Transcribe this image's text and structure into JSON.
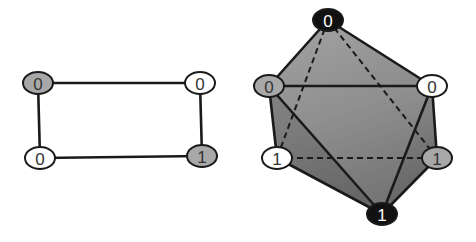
{
  "colors": {
    "stroke": "#1a1a1a",
    "node_white": "#ffffff",
    "node_gray": "#a8a8a8",
    "node_black": "#111111",
    "text_dark": "#333333",
    "text_light": "#ffffff",
    "face_light": "#9a9a9a",
    "face_mid": "#8a8a8a",
    "face_dark": "#6e6e6e"
  },
  "left_graph": {
    "name": "square-graph",
    "nodes": [
      {
        "id": "tl",
        "label": "0",
        "x": 38,
        "y": 83,
        "fill": "gray"
      },
      {
        "id": "tr",
        "label": "0",
        "x": 200,
        "y": 83,
        "fill": "white"
      },
      {
        "id": "bl",
        "label": "0",
        "x": 40,
        "y": 158,
        "fill": "white"
      },
      {
        "id": "br",
        "label": "1",
        "x": 202,
        "y": 156,
        "fill": "gray"
      }
    ],
    "edges": [
      [
        "tl",
        "tr"
      ],
      [
        "tr",
        "br"
      ],
      [
        "br",
        "bl"
      ],
      [
        "bl",
        "tl"
      ]
    ]
  },
  "right_graph": {
    "name": "octahedron-graph",
    "nodes": [
      {
        "id": "top",
        "label": "0",
        "x": 328,
        "y": 20,
        "fill": "black"
      },
      {
        "id": "ul",
        "label": "0",
        "x": 269,
        "y": 86,
        "fill": "gray"
      },
      {
        "id": "ur",
        "label": "0",
        "x": 432,
        "y": 86,
        "fill": "white"
      },
      {
        "id": "ll",
        "label": "1",
        "x": 277,
        "y": 158,
        "fill": "white"
      },
      {
        "id": "lr",
        "label": "1",
        "x": 437,
        "y": 158,
        "fill": "gray"
      },
      {
        "id": "bot",
        "label": "1",
        "x": 382,
        "y": 214,
        "fill": "black"
      }
    ],
    "solid_edges": [
      [
        "top",
        "ul"
      ],
      [
        "top",
        "ur"
      ],
      [
        "ul",
        "ur"
      ],
      [
        "ul",
        "ll"
      ],
      [
        "ur",
        "lr"
      ],
      [
        "ll",
        "bot"
      ],
      [
        "lr",
        "bot"
      ],
      [
        "ul",
        "bot"
      ],
      [
        "ur",
        "bot"
      ]
    ],
    "dashed_edges": [
      [
        "top",
        "ll"
      ],
      [
        "top",
        "lr"
      ],
      [
        "ll",
        "lr"
      ]
    ]
  }
}
